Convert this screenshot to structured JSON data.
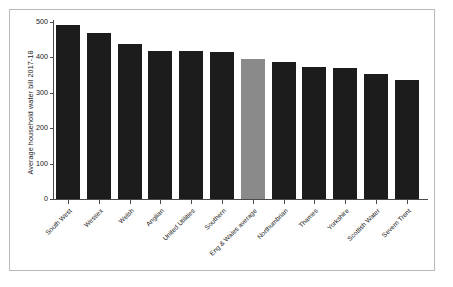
{
  "chart_data": {
    "type": "bar",
    "title": "",
    "xlabel": "",
    "ylabel": "Average household water bill 2017-18",
    "ylim": [
      0,
      500
    ],
    "yticks": [
      0,
      100,
      200,
      300,
      400,
      500
    ],
    "ytick_labels": [
      "0",
      "100",
      "200",
      "300",
      "400",
      "500"
    ],
    "grid": false,
    "legend": "none",
    "categories": [
      "South West",
      "Wessex",
      "Welsh",
      "Anglian",
      "United Utilities",
      "Southern",
      "Eng & Wales average",
      "Northumbrian",
      "Thames",
      "Yorkshire",
      "Scottish Water",
      "Severn Trent"
    ],
    "values": [
      490,
      467,
      437,
      417,
      417,
      415,
      395,
      385,
      372,
      370,
      352,
      335
    ],
    "bar_colors": [
      "#1c1c1c",
      "#1c1c1c",
      "#1c1c1c",
      "#1c1c1c",
      "#1c1c1c",
      "#1c1c1c",
      "#8a8a8a",
      "#1c1c1c",
      "#1c1c1c",
      "#1c1c1c",
      "#1c1c1c",
      "#1c1c1c"
    ],
    "highlight_index": 6,
    "colors": {
      "bar_default": "#1c1c1c",
      "bar_highlight": "#8a8a8a",
      "axis": "#4a4a4a",
      "frame": "#b9b9b9",
      "text": "#1a1a1a",
      "background": "#ffffff"
    }
  }
}
